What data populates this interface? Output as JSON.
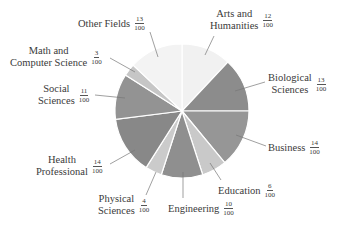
{
  "chart_data": {
    "type": "pie",
    "title": "",
    "unit": "fraction of 100",
    "start_angle_deg": 0,
    "direction": "clockwise",
    "center": [
      182,
      111
    ],
    "radius": 67,
    "slices": [
      {
        "label": "Arts and Humanities",
        "value": 12,
        "fraction": "12/100",
        "color": "#f1f1f1"
      },
      {
        "label": "Biological Sciences",
        "value": 13,
        "fraction": "13/100",
        "color": "#8c8c8c"
      },
      {
        "label": "Business",
        "value": 14,
        "fraction": "14/100",
        "color": "#969696"
      },
      {
        "label": "Education",
        "value": 6,
        "fraction": "6/100",
        "color": "#c9c9c9"
      },
      {
        "label": "Engineering",
        "value": 10,
        "fraction": "10/100",
        "color": "#8f8f8f"
      },
      {
        "label": "Physical Sciences",
        "value": 4,
        "fraction": "4/100",
        "color": "#cbcbcb"
      },
      {
        "label": "Health Professional",
        "value": 14,
        "fraction": "14/100",
        "color": "#888888"
      },
      {
        "label": "Social Sciences",
        "value": 11,
        "fraction": "11/100",
        "color": "#939393"
      },
      {
        "label": "Math and Computer Science",
        "value": 3,
        "fraction": "3/100",
        "color": "#c6c6c6"
      },
      {
        "label": "Other Fields",
        "value": 13,
        "fraction": "13/100",
        "color": "#f3f3f3"
      }
    ]
  },
  "labels": [
    {
      "key": "arts",
      "lines": [
        "Arts and",
        "Humanities"
      ],
      "num": "12",
      "den": "100",
      "x": 210,
      "y": 8,
      "leader": [
        [
          214,
          36
        ],
        [
          205,
          55
        ]
      ]
    },
    {
      "key": "bio",
      "lines": [
        "Biological",
        "Sciences"
      ],
      "num": "13",
      "den": "100",
      "x": 268,
      "y": 72,
      "leader": [
        [
          265,
          82
        ],
        [
          235,
          91
        ]
      ]
    },
    {
      "key": "business",
      "lines": [
        "Business"
      ],
      "num": "14",
      "den": "100",
      "x": 268,
      "y": 139,
      "leader": [
        [
          266,
          146
        ],
        [
          236,
          135
        ]
      ]
    },
    {
      "key": "education",
      "lines": [
        "Education"
      ],
      "num": "6",
      "den": "100",
      "x": 218,
      "y": 182,
      "leader": [
        [
          221,
          180
        ],
        [
          210,
          163
        ]
      ]
    },
    {
      "key": "engineering",
      "lines": [
        "Engineering"
      ],
      "num": "10",
      "den": "100",
      "x": 168,
      "y": 200,
      "leader": [
        [
          183,
          198
        ],
        [
          183,
          172
        ]
      ]
    },
    {
      "key": "physical",
      "lines": [
        "Physical",
        "Sciences"
      ],
      "num": "4",
      "den": "100",
      "x": 98,
      "y": 193,
      "leader": [
        [
          146,
          195
        ],
        [
          156,
          172
        ]
      ]
    },
    {
      "key": "health",
      "lines": [
        "Health",
        "Professional"
      ],
      "num": "14",
      "den": "100",
      "x": 36,
      "y": 154,
      "leader": [
        [
          110,
          164
        ],
        [
          135,
          150
        ]
      ]
    },
    {
      "key": "social",
      "lines": [
        "Social",
        "Sciences"
      ],
      "num": "11",
      "den": "100",
      "x": 38,
      "y": 83,
      "leader": [
        [
          95,
          95
        ],
        [
          125,
          98
        ]
      ]
    },
    {
      "key": "math",
      "lines": [
        "Math and",
        "Computer Science"
      ],
      "num": "3",
      "den": "100",
      "x": 10,
      "y": 45,
      "leader": [
        [
          110,
          58
        ],
        [
          135,
          72
        ]
      ]
    },
    {
      "key": "other",
      "lines": [
        "Other Fields"
      ],
      "num": "13",
      "den": "100",
      "x": 78,
      "y": 15,
      "leader": [
        [
          150,
          32
        ],
        [
          158,
          57
        ]
      ]
    }
  ],
  "style": {
    "separator_color": "#ffffff",
    "leader_color": "#777777"
  }
}
